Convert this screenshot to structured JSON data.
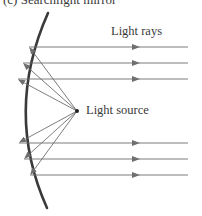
{
  "figure": {
    "caption": "(c) Searchlight mirror",
    "labels": {
      "light_rays": "Light rays",
      "light_source": "Light source"
    },
    "colors": {
      "mirror": "#3a3a3a",
      "ray": "#6e6e6e",
      "text": "#3a3a3a"
    },
    "mirror": {
      "type": "concave-parabolic",
      "top": [
        48,
        13
      ],
      "vertex": [
        13,
        112
      ],
      "bottom": [
        47,
        208
      ]
    },
    "light_source": {
      "x": 77,
      "y": 111
    },
    "reflection_points": [
      {
        "x": 29,
        "y": 47
      },
      {
        "x": 23,
        "y": 63
      },
      {
        "x": 18,
        "y": 79
      },
      {
        "x": 19,
        "y": 143
      },
      {
        "x": 24,
        "y": 159
      },
      {
        "x": 30,
        "y": 175
      }
    ],
    "parallel_ray_end_x": 188,
    "parallel_ray_arrow_x": 137
  }
}
